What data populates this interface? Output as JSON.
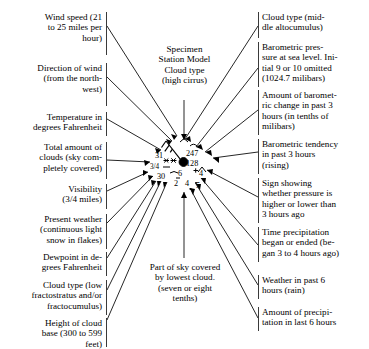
{
  "title": "Specimen Station Model",
  "center_title": {
    "lines": [
      "Specimen",
      "Station Model",
      "Cloud type",
      "(high cirrus)"
    ]
  },
  "bottom_center": {
    "lines": [
      "Part of sky covered",
      "by lowest cloud.",
      "(seven or eight",
      "tenths)"
    ]
  },
  "left_labels": [
    {
      "id": "wind-speed",
      "lines": [
        "Wind speed (21",
        "to 25 miles per",
        "hour)"
      ]
    },
    {
      "id": "wind-direction",
      "lines": [
        "Direction of wind",
        "(from the north-",
        "west)"
      ]
    },
    {
      "id": "temperature",
      "lines": [
        "Temperature in",
        "degrees Fahrenheit"
      ]
    },
    {
      "id": "total-cloud-cover",
      "lines": [
        "Total amount of",
        "clouds (sky com-",
        "pletely covered)"
      ]
    },
    {
      "id": "visibility",
      "lines": [
        "Visibility",
        "(3/4 miles)"
      ]
    },
    {
      "id": "present-weather",
      "lines": [
        "Present weather",
        "(continuous light",
        "snow in flakes)"
      ]
    },
    {
      "id": "dewpoint",
      "lines": [
        "Dewpoint in de-",
        "grees Fahrenheit"
      ]
    },
    {
      "id": "low-cloud-type",
      "lines": [
        "Cloud type (low",
        "fractostratus and/or",
        "fractocumulus)"
      ]
    },
    {
      "id": "cloud-base-height",
      "lines": [
        "Height of cloud",
        "base (300 to 599",
        "feet)"
      ]
    }
  ],
  "right_labels": [
    {
      "id": "middle-cloud-type",
      "lines": [
        "Cloud type (mid-",
        "dle altocumulus)"
      ]
    },
    {
      "id": "sea-level-pressure",
      "lines": [
        "Barometric pres-",
        "sure at sea level.  Ini-",
        "tial 9 or 10 omitted",
        "(1024.7 milibars)"
      ]
    },
    {
      "id": "pressure-change",
      "lines": [
        "Amount of baromet-",
        "ric change in past 3",
        "hours (in tenths of",
        "milibars)"
      ]
    },
    {
      "id": "pressure-tendency",
      "lines": [
        "Barometric tendency",
        "in past 3 hours",
        "(rising)"
      ]
    },
    {
      "id": "pressure-sign",
      "lines": [
        "Sign showing",
        "whether pressure is",
        "higher or lower than",
        "3 hours ago"
      ]
    },
    {
      "id": "precip-time",
      "lines": [
        "Time precipitation",
        "began or ended (be-",
        "gan 3 to 4 hours ago)"
      ]
    },
    {
      "id": "past-weather",
      "lines": [
        "Weather in past 6",
        "hours  (rain)"
      ]
    },
    {
      "id": "precip-amount",
      "lines": [
        "Amount of precipi-",
        "tation in last 6 hours"
      ]
    }
  ],
  "station_model": {
    "temperature": "31",
    "visibility": "3/4",
    "dewpoint": "30",
    "pressure": "247",
    "pressure_change": "128",
    "cloud_base_height": "2",
    "past_weather": "4",
    "precip_amount": "5",
    "precip_time": "6",
    "tendency_value": "4"
  },
  "colors": {
    "ink": "#000000",
    "rule": "#3a3a3a",
    "paper": "#ffffff"
  }
}
